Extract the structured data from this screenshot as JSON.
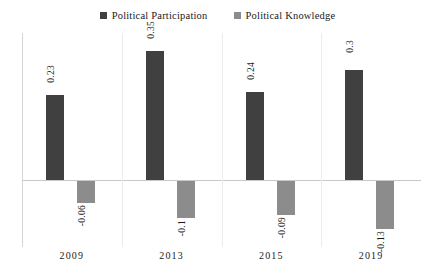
{
  "chart_data": {
    "type": "bar",
    "title": "",
    "subtitle": "",
    "xlabel": "",
    "ylabel": "",
    "categories": [
      "2009",
      "2013",
      "2015",
      "2019"
    ],
    "series": [
      {
        "name": "Political Participation",
        "color": "#404040",
        "values": [
          0.23,
          0.35,
          0.24,
          0.3
        ],
        "labels": [
          "0.23",
          "0.35",
          "0.24",
          "0.3"
        ]
      },
      {
        "name": "Political Knowledge",
        "color": "#8c8c8c",
        "values": [
          -0.06,
          -0.1,
          -0.09,
          -0.13
        ],
        "labels": [
          "-0.06",
          "-0.1",
          "-0.09",
          "-0.13"
        ]
      }
    ],
    "ylim": [
      -0.18,
      0.4
    ],
    "grid": "vertical-category-separators",
    "zero_line": true,
    "legend_position": "top-center",
    "data_label_orientation": "vertical"
  },
  "legend": {
    "items": [
      {
        "label": "Political Participation",
        "color": "#404040"
      },
      {
        "label": "Political Knowledge",
        "color": "#8c8c8c"
      }
    ]
  },
  "axis": {
    "categories": [
      "2009",
      "2013",
      "2015",
      "2019"
    ]
  }
}
